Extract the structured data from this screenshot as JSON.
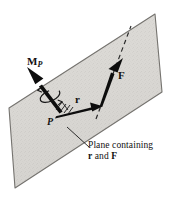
{
  "figure": {
    "labels": {
      "moment": "M",
      "moment_subscript": "P",
      "force": "F",
      "position_vector": "r",
      "point": "P"
    },
    "caption": {
      "line1": "Plane containing",
      "vector_r": "r",
      "conjunction": " and ",
      "vector_f": "F"
    },
    "colors": {
      "plane_fill": "#d9d7d3",
      "plane_edge": "#6f6d6a",
      "vector": "#111111",
      "text": "#111111",
      "background": "#ffffff"
    },
    "geometry": {
      "plane_corners": [
        [
          155,
          14
        ],
        [
          162,
          92
        ],
        [
          15,
          188
        ],
        [
          9,
          108
        ]
      ],
      "point_P": [
        55,
        118
      ],
      "r_tip": [
        102,
        106
      ],
      "F_tail": [
        101,
        106
      ],
      "F_tip": [
        123,
        59
      ],
      "moment_tail": [
        59,
        112
      ],
      "moment_tip": [
        27,
        67
      ],
      "dashed_line": [
        [
          96,
          118
        ],
        [
          130,
          27
        ]
      ],
      "leader_line": [
        [
          88,
          147
        ],
        [
          68,
          128
        ]
      ]
    }
  }
}
